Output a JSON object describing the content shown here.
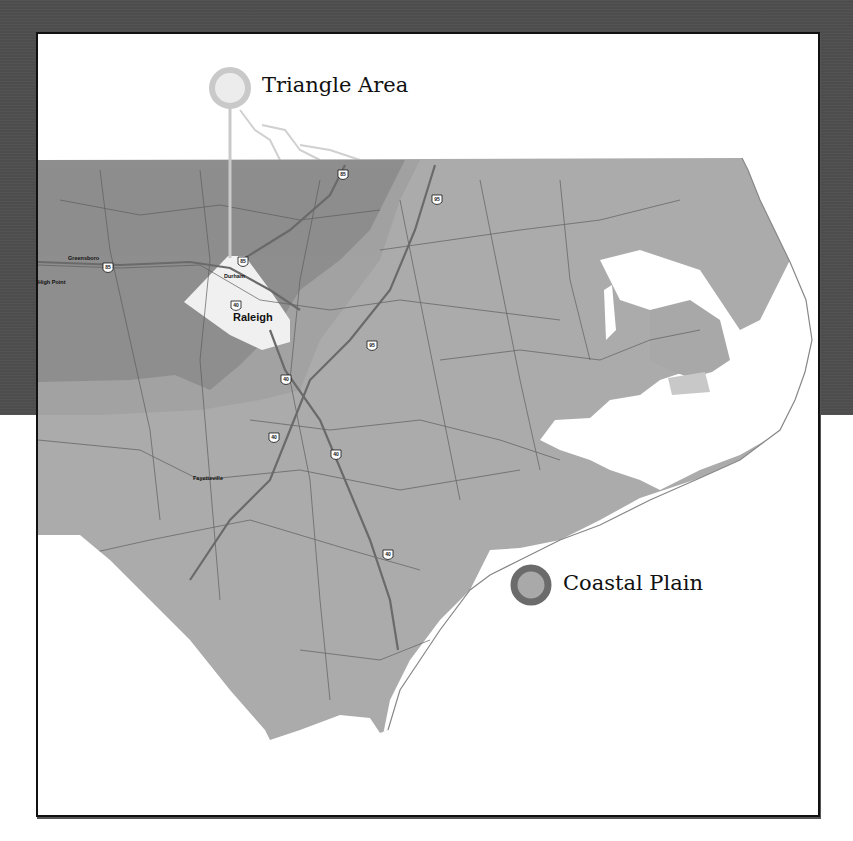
{
  "map": {
    "title": "North Carolina regions",
    "colors": {
      "background_band": "#4d4d4d",
      "frame_border": "#111111",
      "piedmont": "#8e8e8e",
      "transition": "#a2a2a2",
      "coastal": "#ababab",
      "water": "#ffffff",
      "triangle_fill": "#f0f0f0",
      "road": "#5a5a5a",
      "interstate": "#666666"
    },
    "callouts": [
      {
        "id": "triangle",
        "label": "Triangle Area",
        "ring_color": "#c9c9c9",
        "inner_color": "#ececec"
      },
      {
        "id": "coastal",
        "label": "Coastal Plain",
        "ring_color": "#6b6b6b",
        "inner_color": "#a9a9a9"
      }
    ],
    "cities": [
      {
        "name": "Raleigh",
        "size": "large"
      },
      {
        "name": "Durham",
        "size": "small"
      },
      {
        "name": "Greensboro",
        "size": "small"
      },
      {
        "name": "High Point",
        "size": "small"
      },
      {
        "name": "Fayetteville",
        "size": "small"
      }
    ],
    "interstates": [
      "85",
      "85",
      "85",
      "95",
      "95",
      "40",
      "40",
      "40",
      "40"
    ]
  }
}
